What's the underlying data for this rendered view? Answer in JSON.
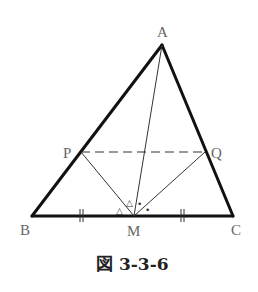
{
  "figure": {
    "caption": "図 3-3-6",
    "points": {
      "A": {
        "label": "A",
        "x": 162,
        "y": 45
      },
      "B": {
        "label": "B",
        "x": 32,
        "y": 216
      },
      "C": {
        "label": "C",
        "x": 233,
        "y": 216
      },
      "M": {
        "label": "M",
        "x": 134,
        "y": 216
      },
      "P": {
        "label": "P",
        "x": 81,
        "y": 152
      },
      "Q": {
        "label": "Q",
        "x": 205,
        "y": 152
      }
    },
    "segments": [
      {
        "from": "A",
        "to": "B",
        "style": "thick"
      },
      {
        "from": "A",
        "to": "C",
        "style": "thick"
      },
      {
        "from": "B",
        "to": "C",
        "style": "thick"
      },
      {
        "from": "A",
        "to": "M",
        "style": "thin"
      },
      {
        "from": "P",
        "to": "M",
        "style": "thin"
      },
      {
        "from": "Q",
        "to": "M",
        "style": "thin"
      },
      {
        "from": "P",
        "to": "Q",
        "style": "dashed"
      }
    ],
    "marks": {
      "triangle_glyph": "△",
      "dot_glyph": "•",
      "equal_tick": "||",
      "angle_marks": [
        "angle PMB (△)",
        "angle PMA (△)",
        "angle AMQ (•)",
        "angle QMC (•)"
      ],
      "equal_segments": [
        "BM",
        "MC"
      ]
    },
    "colors": {
      "line": "#111111",
      "label": "#666666",
      "caption": "#222222"
    }
  }
}
